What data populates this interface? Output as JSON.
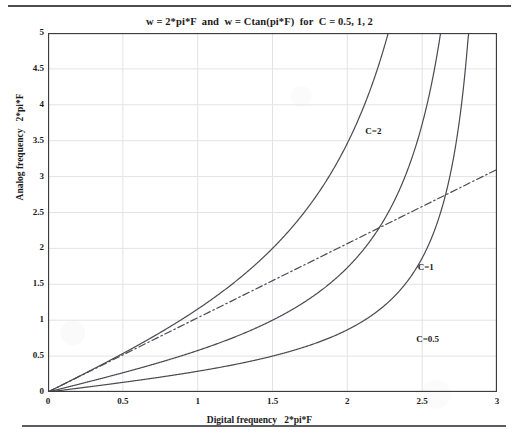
{
  "page": {
    "rule_top": "horizontal-rule",
    "rule_bottom": "horizontal-rule"
  },
  "chart_data": {
    "type": "line",
    "title": "w = 2*pi*F  and  w = Ctan(pi*F)  for  C = 0.5, 1, 2",
    "xlabel": "Digital frequency   2*pi*F",
    "ylabel": "Analog frequency   2*pi*F",
    "xlim": [
      0,
      3
    ],
    "ylim": [
      0,
      5
    ],
    "xticks": [
      "0",
      "0.5",
      "1",
      "1.5",
      "2",
      "2.5",
      "3"
    ],
    "xtick_values": [
      0,
      0.5,
      1,
      1.5,
      2,
      2.5,
      3
    ],
    "yticks": [
      "0",
      "0.5",
      "1",
      "1.5",
      "2",
      "2.5",
      "3",
      "3.5",
      "4",
      "4.5",
      "5"
    ],
    "ytick_values": [
      0,
      0.5,
      1,
      1.5,
      2,
      2.5,
      3,
      3.5,
      4,
      4.5,
      5
    ],
    "grid": true,
    "legend_position": "inline-annotations",
    "line_color": "#4a4a50",
    "grid_color": "#e3e3e6",
    "axis_color": "#3c3c41",
    "series": [
      {
        "name": "w = 2*pi*F",
        "style": "dash-dot",
        "formula": "y = 2*pi*F*x/3.02",
        "slope": 1.0333,
        "x": [
          0,
          0.5,
          1,
          1.5,
          2,
          2.5,
          3
        ],
        "values": [
          0,
          0.517,
          1.033,
          1.55,
          2.067,
          2.583,
          3.1
        ]
      },
      {
        "name": "C=2",
        "style": "solid",
        "formula": "w = 2*tan(pi*F), F = x/6",
        "x": [
          0,
          0.5,
          1,
          1.5,
          2,
          2.2,
          2.35,
          2.42
        ],
        "values": [
          0,
          0.54,
          1.15,
          1.93,
          3.06,
          3.86,
          4.62,
          5.0
        ]
      },
      {
        "name": "C=1",
        "style": "solid",
        "formula": "w = 1*tan(pi*F), F = x/6",
        "x": [
          0,
          0.5,
          1,
          1.5,
          2,
          2.35,
          2.55,
          2.7
        ],
        "values": [
          0,
          0.27,
          0.58,
          0.97,
          1.53,
          2.29,
          3.13,
          5.0
        ]
      },
      {
        "name": "C=0.5",
        "style": "solid",
        "formula": "w = 0.5*tan(pi*F), F = x/6",
        "x": [
          0,
          0.5,
          1,
          1.5,
          2,
          2.5,
          2.75,
          2.84
        ],
        "values": [
          0,
          0.135,
          0.29,
          0.48,
          0.76,
          1.3,
          2.05,
          5.0
        ]
      }
    ],
    "annotations": [
      {
        "label": "C=2",
        "x": 2.12,
        "y": 3.62
      },
      {
        "label": "C=1",
        "x": 2.47,
        "y": 1.73
      },
      {
        "label": "C=0.5",
        "x": 2.46,
        "y": 0.72
      }
    ]
  }
}
